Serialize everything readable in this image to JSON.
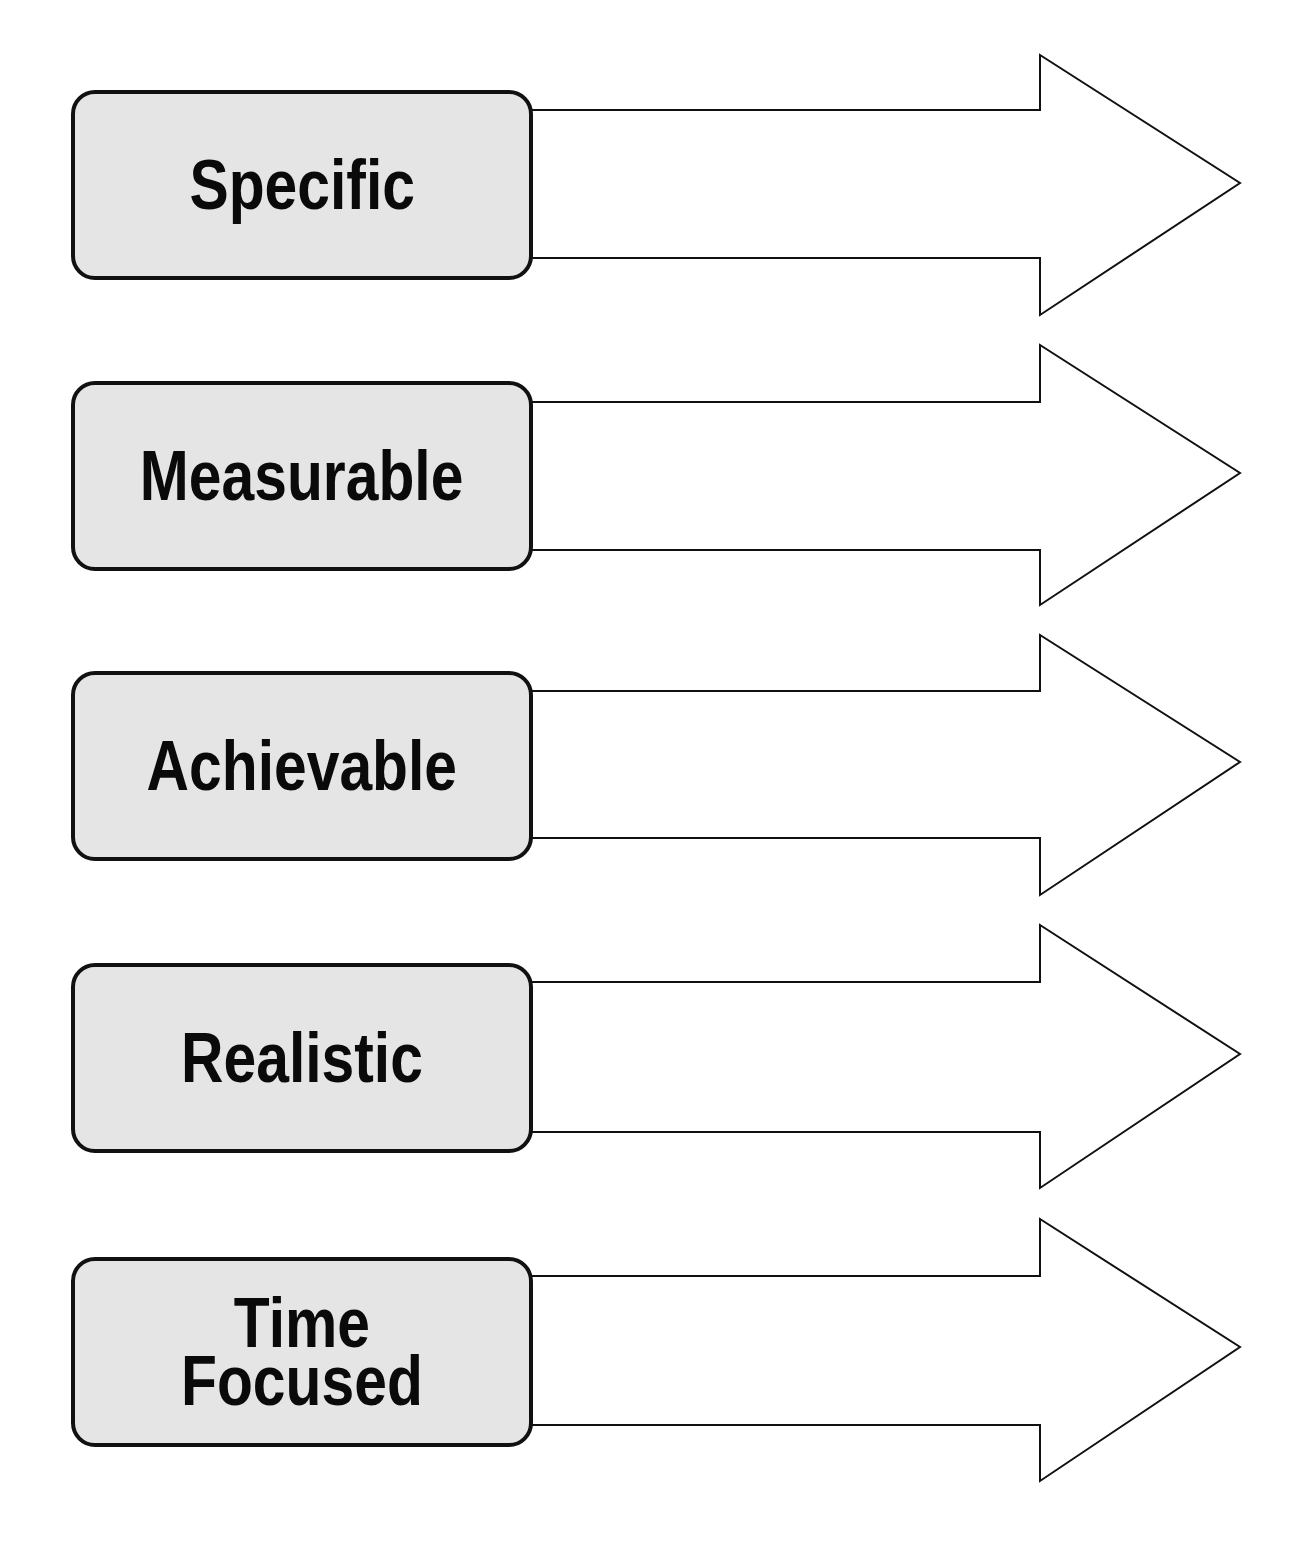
{
  "diagram": {
    "title": "",
    "type": "SMART goals label-arrow diagram",
    "colors": {
      "box_fill": "#e5e5e5",
      "box_border": "#111111",
      "text": "#0a0a0a",
      "arrow_fill": "#ffffff",
      "arrow_stroke": "#111111",
      "background": "#ffffff"
    },
    "items": [
      {
        "label": "Specific",
        "lines": [
          "Specific"
        ],
        "box": {
          "top": 90
        },
        "arrow": {
          "head_top": 55,
          "shaft_top": 110,
          "tip_y": 183,
          "shaft_bottom": 258,
          "head_bottom": 315
        }
      },
      {
        "label": "Measurable",
        "lines": [
          "Measurable"
        ],
        "box": {
          "top": 381
        },
        "arrow": {
          "head_top": 345,
          "shaft_top": 402,
          "tip_y": 473,
          "shaft_bottom": 550,
          "head_bottom": 605
        }
      },
      {
        "label": "Achievable",
        "lines": [
          "Achievable"
        ],
        "box": {
          "top": 671
        },
        "arrow": {
          "head_top": 635,
          "shaft_top": 691,
          "tip_y": 762,
          "shaft_bottom": 838,
          "head_bottom": 895
        }
      },
      {
        "label": "Realistic",
        "lines": [
          "Realistic"
        ],
        "box": {
          "top": 963
        },
        "arrow": {
          "head_top": 925,
          "shaft_top": 982,
          "tip_y": 1054,
          "shaft_bottom": 1132,
          "head_bottom": 1188
        }
      },
      {
        "label": "Time Focused",
        "lines": [
          "Time",
          "Focused"
        ],
        "box": {
          "top": 1257
        },
        "arrow": {
          "head_top": 1219,
          "shaft_top": 1276,
          "tip_y": 1347,
          "shaft_bottom": 1425,
          "head_bottom": 1481
        }
      }
    ],
    "arrow_geometry": {
      "shaft_start_x": 531,
      "notch_x": 1040,
      "tip_x": 1240
    }
  }
}
